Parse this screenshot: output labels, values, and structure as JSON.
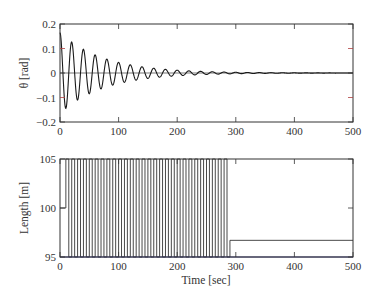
{
  "chart_data": [
    {
      "type": "line",
      "title": "",
      "xlabel": "",
      "ylabel": "θ [rad]",
      "xlim": [
        0,
        500
      ],
      "ylim": [
        -0.2,
        0.2
      ],
      "xticks": [
        "0",
        "100",
        "200",
        "300",
        "400",
        "500"
      ],
      "yticks": [
        "0.2",
        "0.1",
        "0",
        "−0.1",
        "−0.2"
      ],
      "grid": false,
      "legend": null,
      "series": [
        {
          "name": "theta",
          "note": "Modeled approximation, not read point-by-point. Damped oscillation starting near 0.16 rad, visible period roughly 20 s, decaying to near zero by about 300 s. Peak values below are estimates.",
          "approx_peaks": [
            {
              "t": 0,
              "theta": 0.16
            },
            {
              "t": 5,
              "theta": -0.15
            },
            {
              "t": 15,
              "theta": 0.12
            },
            {
              "t": 25,
              "theta": -0.11
            },
            {
              "t": 35,
              "theta": 0.09
            },
            {
              "t": 45,
              "theta": -0.08
            },
            {
              "t": 55,
              "theta": 0.07
            },
            {
              "t": 65,
              "theta": -0.06
            },
            {
              "t": 75,
              "theta": 0.05
            },
            {
              "t": 95,
              "theta": 0.035
            },
            {
              "t": 120,
              "theta": 0.025
            },
            {
              "t": 160,
              "theta": 0.012
            },
            {
              "t": 200,
              "theta": 0.006
            },
            {
              "t": 250,
              "theta": 0.003
            },
            {
              "t": 300,
              "theta": 0.0
            },
            {
              "t": 500,
              "theta": 0.0
            }
          ]
        }
      ]
    },
    {
      "type": "line",
      "title": "",
      "xlabel": "Time [sec]",
      "ylabel": "Length [m]",
      "xlim": [
        0,
        500
      ],
      "ylim": [
        95,
        105
      ],
      "xticks": [
        "0",
        "100",
        "200",
        "300",
        "400",
        "500"
      ],
      "yticks": [
        "105",
        "100",
        "95"
      ],
      "grid": false,
      "legend": null,
      "series": [
        {
          "name": "length",
          "note": "Approximate reading. Bang-bang switching between 95 m and 105 m at roughly 5 s intervals from about 0 to 290 s, then constant near 96.7 m until 500 s. Switching interval and end time are estimated from ~3 px line spacing, not measured against a calibrated axis.",
          "switch_start": 0,
          "switch_end": 290,
          "switch_interval": 5,
          "low": 95,
          "high": 105,
          "final_value": 96.7,
          "initial_segment": {
            "t": [
              0,
              10
            ],
            "length": 100
          }
        }
      ]
    }
  ],
  "top_plot": {
    "ylabel": "θ [rad]",
    "yticks": [
      "0.2",
      "0.1",
      "0",
      "−0.1",
      "−0.2"
    ],
    "xticks": [
      "0",
      "100",
      "200",
      "300",
      "400",
      "500"
    ]
  },
  "bottom_plot": {
    "ylabel": "Length [m]",
    "xlabel": "Time [sec]",
    "yticks": [
      "105",
      "100",
      "95"
    ],
    "xticks": [
      "0",
      "100",
      "200",
      "300",
      "400",
      "500"
    ]
  }
}
